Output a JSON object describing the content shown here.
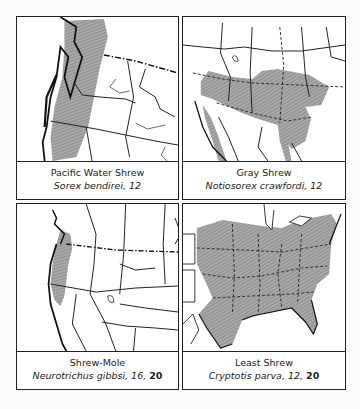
{
  "figure": {
    "panels": [
      {
        "position": "top-left",
        "common_name": "Pacific Water Shrew",
        "scientific_name": "Sorex bendirei",
        "page_refs": "12",
        "bold_ref": "",
        "range_region": "Pacific Northwest coast (W Washington, W Oregon, NW California)"
      },
      {
        "position": "top-right",
        "common_name": "Gray Shrew",
        "scientific_name": "Notiosorex crawfordi",
        "page_refs": "12",
        "bold_ref": "",
        "range_region": "Southwestern US and northern Mexico"
      },
      {
        "position": "bottom-left",
        "common_name": "Shrew-Mole",
        "scientific_name": "Neurotrichus gibbsi",
        "page_refs": "16",
        "bold_ref": "20",
        "range_region": "Pacific coast from SW British Columbia to NW California"
      },
      {
        "position": "bottom-right",
        "common_name": "Least Shrew",
        "scientific_name": "Cryptotis parva",
        "page_refs": "12",
        "bold_ref": "20",
        "range_region": "Eastern United States"
      }
    ],
    "colors": {
      "range_fill": "#9a9a9a",
      "border": "#222222",
      "background": "#ffffff"
    }
  }
}
